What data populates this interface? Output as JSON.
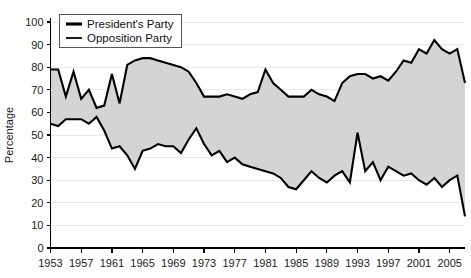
{
  "chart_data": {
    "type": "area",
    "title": "",
    "subtitle": "",
    "xlabel": "",
    "ylabel": "Percentage",
    "xlim": [
      1953,
      2008
    ],
    "ylim": [
      0,
      100
    ],
    "grid": true,
    "legend_position": "top-left",
    "y_ticks": [
      0,
      10,
      20,
      30,
      40,
      50,
      60,
      70,
      80,
      90,
      100
    ],
    "x_ticks": [
      1953,
      1957,
      1961,
      1965,
      1969,
      1973,
      1977,
      1981,
      1985,
      1989,
      1993,
      1997,
      2001,
      2005
    ],
    "x": [
      1953,
      1954,
      1955,
      1956,
      1957,
      1958,
      1959,
      1960,
      1961,
      1962,
      1963,
      1964,
      1965,
      1966,
      1967,
      1968,
      1969,
      1970,
      1971,
      1972,
      1973,
      1974,
      1975,
      1976,
      1977,
      1978,
      1979,
      1980,
      1981,
      1982,
      1983,
      1984,
      1985,
      1986,
      1987,
      1988,
      1989,
      1990,
      1991,
      1992,
      1993,
      1994,
      1995,
      1996,
      1997,
      1998,
      1999,
      2000,
      2001,
      2002,
      2003,
      2004,
      2005,
      2006,
      2007
    ],
    "series": [
      {
        "name": "President's Party",
        "style": "thick-line",
        "color": "#000000",
        "values": [
          79,
          79,
          67,
          78,
          66,
          70,
          62,
          63,
          77,
          64,
          81,
          83,
          84,
          84,
          83,
          82,
          81,
          80,
          78,
          73,
          67,
          67,
          67,
          68,
          67,
          66,
          68,
          69,
          79,
          73,
          70,
          67,
          67,
          67,
          70,
          68,
          67,
          65,
          73,
          76,
          77,
          77,
          75,
          76,
          74,
          78,
          83,
          82,
          88,
          86,
          92,
          88,
          86,
          88,
          73
        ]
      },
      {
        "name": "Opposition Party",
        "style": "thin-line",
        "color": "#000000",
        "values": [
          55,
          54,
          57,
          57,
          57,
          55,
          58,
          52,
          44,
          45,
          41,
          35,
          43,
          44,
          46,
          45,
          45,
          42,
          48,
          53,
          46,
          41,
          43,
          38,
          40,
          37,
          36,
          35,
          34,
          33,
          31,
          27,
          26,
          30,
          34,
          31,
          29,
          32,
          34,
          29,
          51,
          34,
          38,
          30,
          36,
          34,
          32,
          33,
          30,
          28,
          31,
          27,
          30,
          32,
          14
        ]
      }
    ]
  },
  "legend": {
    "entries": [
      {
        "label": "President's Party",
        "style": "thick"
      },
      {
        "label": "Opposition Party",
        "style": "thin"
      }
    ]
  },
  "axes": {
    "y_title": "Percentage",
    "y_tick_labels": [
      "100",
      "90",
      "80",
      "70",
      "60",
      "50",
      "40",
      "30",
      "20",
      "10",
      "0"
    ],
    "x_tick_labels": [
      "1953",
      "1957",
      "1961",
      "1965",
      "1969",
      "1973",
      "1977",
      "1981",
      "1985",
      "1989",
      "1993",
      "1997",
      "2001",
      "2005"
    ]
  },
  "colors": {
    "band_fill": "#d4d4d4",
    "line": "#000000",
    "grid": "#e9e9e9",
    "background": "#ffffff"
  }
}
